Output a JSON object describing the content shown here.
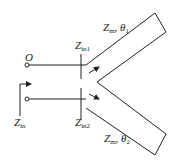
{
  "diagram": {
    "labels": {
      "port": "O",
      "zin1": {
        "main": "Z",
        "sub": "in1"
      },
      "zin2": {
        "main": "Z",
        "sub": "in2"
      },
      "zin": {
        "main": "Z",
        "sub": "in"
      },
      "branch1": {
        "main": "Z",
        "sub": "m",
        "sep": ", ",
        "theta": "θ",
        "theta_sub": "1"
      },
      "branch2": {
        "main": "Z",
        "sub": "m",
        "sep": ", ",
        "theta": "θ",
        "theta_sub": "2"
      }
    },
    "colors": {
      "stroke": "#222222",
      "background": "#ffffff"
    }
  }
}
